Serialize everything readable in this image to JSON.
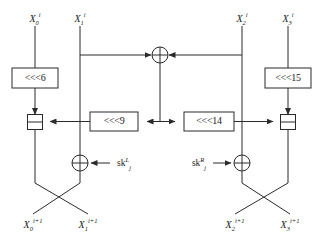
{
  "figure": {
    "type": "block-diagram",
    "domain": "cryptographic-round-function",
    "canvas": {
      "width": 320,
      "height": 238,
      "background": "#ffffff"
    },
    "line_color": "#2b2b2b",
    "text_color": "#1a1a1a"
  },
  "inputs": [
    {
      "id": "in-x0",
      "base": "X",
      "sub": "0",
      "sup": "i",
      "x": 35,
      "y": 18
    },
    {
      "id": "in-x1",
      "base": "X",
      "sub": "1",
      "sup": "i",
      "x": 80,
      "y": 18
    },
    {
      "id": "in-x2",
      "base": "X",
      "sub": "2",
      "sup": "i",
      "x": 242,
      "y": 18
    },
    {
      "id": "in-x3",
      "base": "X",
      "sub": "3",
      "sup": "i",
      "x": 288,
      "y": 18
    }
  ],
  "outputs": [
    {
      "id": "out-x0",
      "base": "X",
      "sub": "0",
      "sup": "i+1",
      "x": 33,
      "y": 224
    },
    {
      "id": "out-x1",
      "base": "X",
      "sub": "1",
      "sup": "i+1",
      "x": 88,
      "y": 224
    },
    {
      "id": "out-x2",
      "base": "X",
      "sub": "2",
      "sup": "i+1",
      "x": 235,
      "y": 224
    },
    {
      "id": "out-x3",
      "base": "X",
      "sub": "3",
      "sup": "i+1",
      "x": 290,
      "y": 224
    }
  ],
  "rotations": [
    {
      "id": "rot-6",
      "label": "<<<6",
      "x": 12,
      "y": 68,
      "w": 46,
      "h": 20
    },
    {
      "id": "rot-9",
      "label": "<<<9",
      "x": 90,
      "y": 112,
      "w": 48,
      "h": 19
    },
    {
      "id": "rot-14",
      "label": "<<<14",
      "x": 184,
      "y": 112,
      "w": 50,
      "h": 19
    },
    {
      "id": "rot-15",
      "label": "<<<15",
      "x": 265,
      "y": 68,
      "w": 46,
      "h": 20
    }
  ],
  "xor_nodes": [
    {
      "id": "xor-top",
      "cx": 160,
      "cy": 55,
      "r": 8
    },
    {
      "id": "xor-left",
      "cx": 80,
      "cy": 163,
      "r": 8
    },
    {
      "id": "xor-right",
      "cx": 242,
      "cy": 163,
      "r": 8
    }
  ],
  "add_nodes": [
    {
      "id": "add-left",
      "cx": 35,
      "cy": 122,
      "size": 15
    },
    {
      "id": "add-right",
      "cx": 288,
      "cy": 122,
      "size": 15
    }
  ],
  "subkeys": [
    {
      "id": "sk-left",
      "base": "sk",
      "sup": "L",
      "sub": "j",
      "x": 124,
      "y": 166,
      "arrow_from": 110,
      "arrow_to": 91,
      "arrow_y": 163
    },
    {
      "id": "sk-right",
      "base": "sk",
      "sup": "R",
      "sub": "j",
      "x": 199,
      "y": 166,
      "arrow_from": 213,
      "arrow_to": 231,
      "arrow_y": 163
    }
  ],
  "legend": {
    "xor_symbol": "⊕",
    "add_symbol": "⊞",
    "rotate_symbol": "<<<"
  },
  "wires": {
    "x0_down_to_rot6": "X0 input drops into <<<6",
    "rot6_down_to_add": "<<<6 output drops into left modular adder",
    "x1_branch_right": "X1 branches right toward top XOR",
    "x2_branch_left": "X2 branches left toward top XOR",
    "xor_top_down": "top XOR result drops to middle bus",
    "bus_to_rot9": "middle bus feeds <<<9 leftward",
    "bus_to_rot14": "middle bus feeds <<<14 rightward",
    "rot9_to_add_left": "<<<9 output feeds left adder",
    "rot14_to_add_right": "<<<14 output feeds right adder",
    "x3_down_to_rot15": "X3 input drops into <<<15",
    "rot15_down_to_add": "<<<15 output drops into right modular adder",
    "x1_down_to_xor_left": "X1 continues down into left subkey XOR",
    "x2_down_to_xor_right": "X2 continues down into right subkey XOR",
    "cross_left": "left adder output and left XOR output cross",
    "cross_right": "right adder output and right XOR output cross"
  }
}
